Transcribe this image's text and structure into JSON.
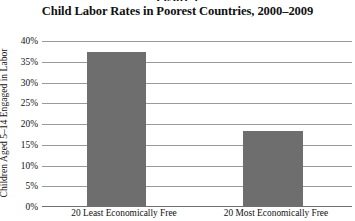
{
  "figure_fragment": "Figure 1",
  "chart_data": {
    "type": "bar",
    "title": "Child Labor Rates in Poorest Countries, 2000–2009",
    "xlabel": "",
    "ylabel": "Children Aged 5–14 Engaged in Labor",
    "categories": [
      "20 Least Economically Free",
      "20 Most Economically Free"
    ],
    "values": [
      37.3,
      18.4
    ],
    "value_labels": [
      "37%",
      "18%"
    ],
    "ylim": [
      0,
      40
    ],
    "ytick_values": [
      40,
      35,
      30,
      25,
      20,
      15,
      10,
      5,
      0
    ],
    "ytick_labels": [
      "40%",
      "35%",
      "30%",
      "25%",
      "20%",
      "15%",
      "10%",
      "5%",
      "0%"
    ],
    "grid": true,
    "legend": false,
    "bar_color": "#6e6e6e",
    "gridline_color": "#9a9a9a",
    "background_color": "#ffffff"
  }
}
